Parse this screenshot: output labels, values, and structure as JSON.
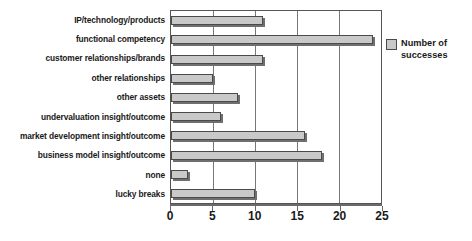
{
  "chart_data": {
    "type": "bar",
    "orientation": "horizontal",
    "title": "",
    "xlabel": "",
    "ylabel": "",
    "xlim": [
      0,
      25
    ],
    "xticks": [
      0,
      5,
      10,
      15,
      20,
      25
    ],
    "grid": true,
    "legend_position": "right",
    "series": [
      {
        "name": "Number of successes",
        "color": "#c9c9c9",
        "values": [
          11,
          24,
          11,
          5,
          8,
          6,
          16,
          18,
          2,
          10
        ]
      }
    ],
    "categories": [
      "IP/technology/products",
      "functional competency",
      "customer relationships/brands",
      "other relationships",
      "other assets",
      "undervaluation insight/outcome",
      "market development insight/outcome",
      "business model insight/outcome",
      "none",
      "lucky breaks"
    ]
  },
  "legend": {
    "label": "Number of successes"
  },
  "axis": {
    "tick_labels": [
      "0",
      "5",
      "10",
      "15",
      "20",
      "25"
    ]
  }
}
